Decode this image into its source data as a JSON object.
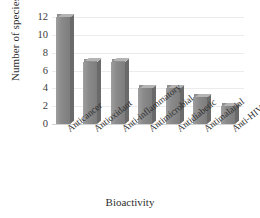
{
  "chart_data": {
    "type": "bar",
    "title": "",
    "subtitle": "",
    "xlabel": "Bioactivity",
    "ylabel": "Number of species",
    "categories": [
      "Anticancer",
      "Antioxidant",
      "Anti-inflammatory",
      "Antimicrobial",
      "Antidiabetic",
      "Antimalarial",
      "Anti-HIV"
    ],
    "values": [
      12,
      7,
      7,
      4,
      4,
      3,
      2
    ],
    "ylim": [
      0,
      12
    ],
    "yticks": [
      0,
      2,
      4,
      6,
      8,
      10,
      12
    ],
    "ytick_labels": [
      "0",
      "2",
      "4",
      "6",
      "8",
      "10",
      "12"
    ],
    "grid": true,
    "grid_axis": "y",
    "legend": false,
    "legend_position": "none",
    "bar_style": "3d-column",
    "colors": {
      "bar_face": "#8a8a8a",
      "bar_side": "#6a6a6a",
      "bar_top": "#b4b4b4",
      "gridline": "#ececed",
      "baseline": "#d2d3d4",
      "text": "#2f2f2f",
      "background": "#ffffff"
    }
  }
}
